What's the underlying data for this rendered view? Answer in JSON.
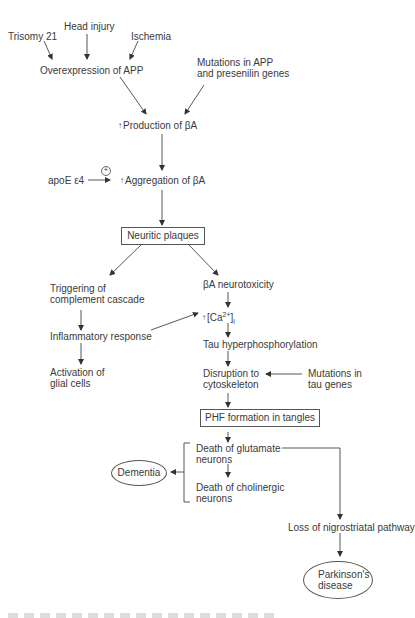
{
  "diagram": {
    "type": "flowchart",
    "topic": "Pathogenesis cascade of Alzheimer's disease",
    "nodes": {
      "trisomy21": "Trisomy 21",
      "head_injury": "Head injury",
      "ischemia": "Ischemia",
      "overexpression_app": "Overexpression of APP",
      "mutations_app_line1": "Mutations in APP",
      "mutations_app_line2": "and presenilin genes",
      "production_ba": "Production of βA",
      "apoe": "apoE ε4",
      "plus_sign": "+",
      "aggregation_ba": "Aggregation of βA",
      "neuritic_plaques": "Neuritic plaques",
      "complement_line1": "Triggering of",
      "complement_line2": "complement cascade",
      "ba_neurotoxicity": "βA neurotoxicity",
      "ca_prefix": "[Ca",
      "ca_sup": "2+",
      "ca_suffix": "]",
      "ca_sub": "i",
      "inflammatory": "Inflammatory response",
      "tau_hyper": "Tau hyperphosphorylation",
      "glial_line1": "Activation of",
      "glial_line2": "glial cells",
      "disruption_line1": "Disruption to",
      "disruption_line2": "cytoskeleton",
      "tau_mut_line1": "Mutations in",
      "tau_mut_line2": "tau genes",
      "phf": "PHF formation in tangles",
      "glutamate_line1": "Death of glutamate",
      "glutamate_line2": "neurons",
      "cholinergic_line1": "Death of cholinergic",
      "cholinergic_line2": "neurons",
      "dementia": "Dementia",
      "nigrostriatal": "Loss of nigrostriatal pathway",
      "parkinsons_line1": "Parkinson's",
      "parkinsons_line2": "disease"
    },
    "increase_marker": "↑",
    "edges": [
      [
        "Trisomy 21",
        "Overexpression of APP"
      ],
      [
        "Head injury",
        "Overexpression of APP"
      ],
      [
        "Ischemia",
        "Overexpression of APP"
      ],
      [
        "Overexpression of APP",
        "Production of βA"
      ],
      [
        "Mutations in APP and presenilin genes",
        "Production of βA"
      ],
      [
        "Production of βA",
        "Aggregation of βA"
      ],
      [
        "apoE ε4",
        "Aggregation of βA"
      ],
      [
        "Aggregation of βA",
        "Neuritic plaques"
      ],
      [
        "Neuritic plaques",
        "Triggering of complement cascade"
      ],
      [
        "Neuritic plaques",
        "βA neurotoxicity"
      ],
      [
        "Triggering of complement cascade",
        "Inflammatory response"
      ],
      [
        "Inflammatory response",
        "Activation of glial cells"
      ],
      [
        "Inflammatory response",
        "[Ca2+]i"
      ],
      [
        "βA neurotoxicity",
        "[Ca2+]i"
      ],
      [
        "[Ca2+]i",
        "Tau hyperphosphorylation"
      ],
      [
        "Tau hyperphosphorylation",
        "Disruption to cytoskeleton"
      ],
      [
        "Mutations in tau genes",
        "Disruption to cytoskeleton"
      ],
      [
        "Disruption to cytoskeleton",
        "PHF formation in tangles"
      ],
      [
        "PHF formation in tangles",
        "Death of glutamate neurons"
      ],
      [
        "Death of glutamate neurons",
        "Death of cholinergic neurons"
      ],
      [
        "Death of neurons (bracket)",
        "Dementia"
      ],
      [
        "Death of glutamate neurons",
        "Loss of nigrostriatal pathway"
      ],
      [
        "Loss of nigrostriatal pathway",
        "Parkinson's disease"
      ]
    ]
  }
}
